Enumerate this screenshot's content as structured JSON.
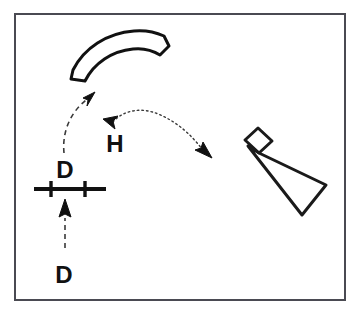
{
  "figure": {
    "background_color": "#ffffff",
    "width": 361,
    "height": 315
  },
  "frame": {
    "name": "outer-border",
    "stroke_color": "#4a4a52",
    "stroke_width": 2,
    "x": 14,
    "y": 13,
    "width": 331,
    "height": 287
  },
  "labels": {
    "d_upper": {
      "text": "D",
      "x": 65,
      "y": 178,
      "font_size": 24,
      "color": "#111111"
    },
    "d_lower": {
      "text": "D",
      "x": 64,
      "y": 283,
      "font_size": 24,
      "color": "#111111"
    },
    "h_middle": {
      "text": "H",
      "x": 115,
      "y": 152,
      "font_size": 24,
      "color": "#111111"
    }
  },
  "shapes": {
    "curved_bar": {
      "name": "curved-arc-shape",
      "description": "thick open crescent / curved bar outline at top left",
      "stroke_color": "#111111",
      "stroke_width": 3,
      "fill": "none"
    },
    "tick_line": {
      "name": "line-with-two-ticks",
      "description": "thick horizontal segment with two vertical tick marks",
      "stroke_color": "#111111",
      "stroke_width": 4,
      "x_start": 34,
      "x_end": 106,
      "y": 189,
      "tick_positions": [
        51,
        85
      ],
      "tick_half_height": 7
    },
    "wedge_tool": {
      "name": "wedge-tool-shape",
      "description": "tapering quadrilateral with small parallelogram head at top left",
      "stroke_color": "#1a1a1a",
      "stroke_width": 3,
      "fill": "none"
    }
  },
  "arrows": {
    "dashed_curve_to_arc": {
      "name": "dashed-curved-arrow-up-right",
      "style": "dashed",
      "stroke_color": "#3a3a3a",
      "stroke_width": 1.6,
      "dash_pattern": "5,4",
      "head_at": "upper-right"
    },
    "dashed_vertical_up": {
      "name": "dashed-vertical-arrow-up",
      "style": "dashed",
      "stroke_color": "#3a3a3a",
      "stroke_width": 1.6,
      "dash_pattern": "5,4",
      "head_at": "top"
    },
    "dotted_double_arc": {
      "name": "dotted-double-headed-arc-arrow",
      "style": "dotted",
      "stroke_color": "#3a3a3a",
      "stroke_width": 1.4,
      "dash_pattern": "1.5,3",
      "head_at": "both-ends"
    }
  }
}
